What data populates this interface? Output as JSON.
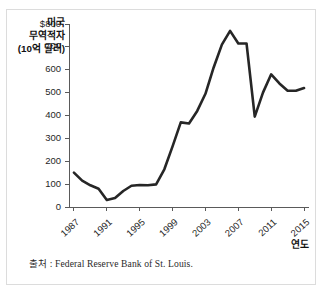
{
  "source_note": "출처 : Federal Reserve Bank of St. Louis.",
  "chart_data": {
    "type": "line",
    "title": "",
    "subtitle": "",
    "ylabel": "미국\n무역적자\n(10억 달러)",
    "ylabel_lines": [
      "미국",
      "무역적자",
      "(10억 달러)"
    ],
    "xlabel": "연도",
    "x": [
      1987,
      1988,
      1989,
      1990,
      1991,
      1992,
      1993,
      1994,
      1995,
      1996,
      1997,
      1998,
      1999,
      2000,
      2001,
      2002,
      2003,
      2004,
      2005,
      2006,
      2007,
      2008,
      2009,
      2010,
      2011,
      2012,
      2013,
      2014,
      2015
    ],
    "values": [
      150,
      115,
      95,
      80,
      31,
      39,
      70,
      93,
      96,
      95,
      99,
      165,
      265,
      370,
      365,
      420,
      495,
      610,
      710,
      770,
      715,
      715,
      395,
      500,
      580,
      540,
      508,
      508,
      520
    ],
    "xtick_values": [
      1987,
      1991,
      1995,
      1999,
      2003,
      2007,
      2011,
      2015
    ],
    "xtick_labels": [
      "1987",
      "1991",
      "1995",
      "1999",
      "2003",
      "2007",
      "2011",
      "2015"
    ],
    "ytick_values": [
      0,
      100,
      200,
      300,
      400,
      500,
      600,
      700,
      800
    ],
    "ytick_labels": [
      "0",
      "100",
      "200",
      "300",
      "400",
      "500",
      "600",
      "700",
      "$800"
    ],
    "xlim": [
      1986.4,
      2015.6
    ],
    "ylim": [
      0,
      800
    ],
    "grid": false,
    "legend": false,
    "line_color": "#262626",
    "axis_color": "#5a5a5a",
    "units": "10억 달러"
  }
}
